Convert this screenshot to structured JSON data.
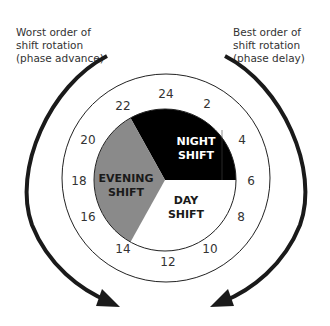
{
  "captions": {
    "left": [
      "Worst order of",
      "shift rotation",
      "(phase advance)"
    ],
    "right": [
      "Best order of",
      "shift rotation",
      "(phase delay)"
    ]
  },
  "clock": {
    "hours": [
      "24",
      "2",
      "4",
      "6",
      "8",
      "10",
      "12",
      "14",
      "16",
      "18",
      "20",
      "22"
    ]
  },
  "segments": {
    "night": {
      "line1": "NIGHT",
      "line2": "SHIFT",
      "color": "#000000",
      "text_color": "#ffffff",
      "start_hour": 22,
      "end_hour": 6
    },
    "evening": {
      "line1": "EVENING",
      "line2": "SHIFT",
      "color": "#8a8a8a",
      "text_color": "#1a1a1a",
      "start_hour": 14,
      "end_hour": 22
    },
    "day": {
      "line1": "DAY",
      "line2": "SHIFT",
      "color": "#ffffff",
      "text_color": "#1a1a1a",
      "start_hour": 6,
      "end_hour": 14
    }
  }
}
